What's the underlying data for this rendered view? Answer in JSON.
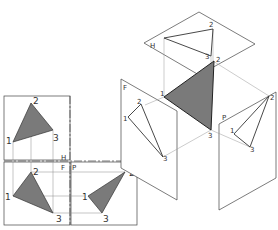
{
  "diagram": {
    "colors": {
      "fill": "#7a7a7a",
      "stroke": "#333333",
      "thin": "#777777",
      "bg": "#ffffff"
    },
    "orthographic": {
      "fold_labels": {
        "h": "H",
        "f": "F",
        "p": "P"
      },
      "top_view": {
        "points": [
          "1",
          "2",
          "3"
        ]
      },
      "front_view": {
        "points": [
          "1",
          "2",
          "3"
        ]
      },
      "side_view": {
        "points": [
          "1",
          "2",
          "3"
        ]
      }
    },
    "pictorial": {
      "planes": {
        "h": "H",
        "f": "F",
        "p": "P"
      },
      "h_points": [
        "1",
        "2",
        "3"
      ],
      "f_points": [
        "1",
        "2",
        "3"
      ],
      "p_points": [
        "1",
        "2",
        "3"
      ],
      "solid_points": [
        "1",
        "2",
        "3"
      ]
    }
  }
}
